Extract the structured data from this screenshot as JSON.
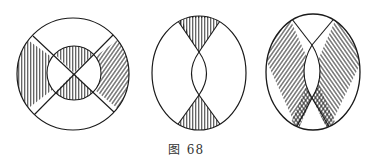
{
  "figure": {
    "caption_prefix": "图",
    "caption_number": "68"
  },
  "panels": [
    {
      "id": "left",
      "shape": "circle",
      "description": "Circle with inner circle and X cross; shaded left/right outer sectors and top/bottom inner sectors"
    },
    {
      "id": "middle",
      "shape": "ellipse",
      "description": "Ellipse with central lens; shaded top and bottom triangular sectors"
    },
    {
      "id": "right",
      "shape": "ellipse",
      "description": "Ellipse with central lens; two crossing diagonal hatched bands"
    }
  ],
  "colors": {
    "stroke": "#1a1a1a",
    "background": "#ffffff"
  }
}
